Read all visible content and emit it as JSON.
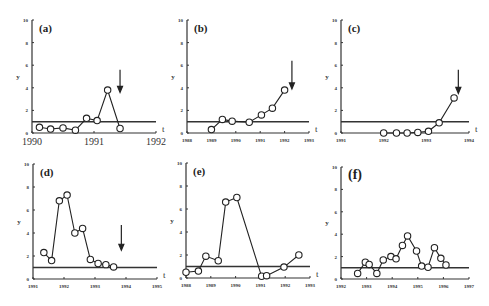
{
  "chart_data": [
    {
      "id": "a",
      "type": "line",
      "panel_label": "(a)",
      "ylabel": "y",
      "xlabel": "t",
      "ylim": [
        0,
        10
      ],
      "yticks": [
        0,
        2,
        4,
        6,
        8,
        10
      ],
      "xtick_labels": [
        "1990",
        "1991",
        "1992"
      ],
      "xlim": [
        1990,
        1992
      ],
      "threshold": 1,
      "points": [
        [
          1990.12,
          0.5
        ],
        [
          1990.3,
          0.35
        ],
        [
          1990.5,
          0.45
        ],
        [
          1990.7,
          0.25
        ],
        [
          1990.88,
          1.3
        ],
        [
          1991.05,
          1.1
        ],
        [
          1991.22,
          3.8
        ],
        [
          1991.42,
          0.4
        ]
      ],
      "arrow_x": 1991.42,
      "arrow_y_top": 5.6,
      "arrow_y_bottom": 3.6,
      "box": {
        "x": 32,
        "y": 20,
        "w": 124,
        "h": 113
      }
    },
    {
      "id": "b",
      "type": "line",
      "panel_label": "(b)",
      "ylabel": "y",
      "xlabel": "t",
      "ylim": [
        0,
        10
      ],
      "yticks": [
        0,
        2,
        4,
        6,
        8,
        10
      ],
      "xtick_labels": [
        "1988",
        "1989",
        "1990",
        "1991",
        "1992",
        "1993"
      ],
      "xlim": [
        1988,
        1993
      ],
      "threshold": 1,
      "points": [
        [
          1989,
          0.3
        ],
        [
          1989.45,
          1.2
        ],
        [
          1989.85,
          1.05
        ],
        [
          1990.55,
          0.95
        ],
        [
          1991.05,
          1.6
        ],
        [
          1991.5,
          2.2
        ],
        [
          1992,
          3.8
        ]
      ],
      "arrow_x": 1992.3,
      "arrow_y_top": 6.4,
      "arrow_y_bottom": 3.9,
      "box": {
        "x": 187,
        "y": 20,
        "w": 122,
        "h": 113
      }
    },
    {
      "id": "c",
      "type": "line",
      "panel_label": "(c)",
      "ylabel": "y",
      "xlabel": "t",
      "ylim": [
        0,
        10
      ],
      "yticks": [
        0,
        2,
        4,
        6,
        8,
        10
      ],
      "xtick_labels": [
        "1991",
        "1992",
        "1993",
        "1994"
      ],
      "xlim": [
        1991,
        1994
      ],
      "threshold": 1,
      "points": [
        [
          1992,
          0
        ],
        [
          1992.3,
          0
        ],
        [
          1992.55,
          0
        ],
        [
          1992.8,
          0.05
        ],
        [
          1993.05,
          0.15
        ],
        [
          1993.3,
          0.9
        ],
        [
          1993.65,
          3.1
        ]
      ],
      "arrow_x": 1993.75,
      "arrow_y_top": 5.6,
      "arrow_y_bottom": 3.5,
      "box": {
        "x": 341,
        "y": 20,
        "w": 128,
        "h": 113
      }
    },
    {
      "id": "d",
      "type": "line",
      "panel_label": "(d)",
      "ylabel": "y",
      "xlabel": "t",
      "ylim": [
        0,
        10
      ],
      "yticks": [
        0,
        2,
        4,
        6,
        8,
        10
      ],
      "xtick_labels": [
        "1991",
        "1992",
        "1993",
        "1994",
        "1995"
      ],
      "xlim": [
        1991,
        1995
      ],
      "threshold": 1,
      "points": [
        [
          1991.35,
          2.3
        ],
        [
          1991.6,
          1.6
        ],
        [
          1991.85,
          6.8
        ],
        [
          1992.1,
          7.3
        ],
        [
          1992.35,
          4.0
        ],
        [
          1992.6,
          4.4
        ],
        [
          1992.85,
          1.7
        ],
        [
          1993.1,
          1.35
        ],
        [
          1993.35,
          1.25
        ],
        [
          1993.6,
          1.05
        ]
      ],
      "arrow_x": 1993.85,
      "arrow_y_top": 4.7,
      "arrow_y_bottom": 2.5,
      "box": {
        "x": 33,
        "y": 164,
        "w": 124,
        "h": 115
      }
    },
    {
      "id": "e",
      "type": "line",
      "panel_label": "(e)",
      "ylabel": "y",
      "xlabel": "t",
      "ylim": [
        0,
        10
      ],
      "yticks": [
        0,
        2,
        4,
        6,
        8,
        10
      ],
      "xtick_labels": [
        "1988",
        "1989",
        "1990",
        "1991",
        "1992",
        "1993"
      ],
      "xlim": [
        1988,
        1993
      ],
      "threshold": 1,
      "points": [
        [
          1988,
          0.5
        ],
        [
          1988.5,
          0.6
        ],
        [
          1988.8,
          1.9
        ],
        [
          1989.3,
          1.5
        ],
        [
          1989.6,
          6.6
        ],
        [
          1990.05,
          7.0
        ],
        [
          1991.05,
          0.15
        ],
        [
          1991.25,
          0.2
        ],
        [
          1991.95,
          0.95
        ],
        [
          1992.55,
          2.0
        ]
      ],
      "box": {
        "x": 186,
        "y": 163,
        "w": 124,
        "h": 115
      }
    },
    {
      "id": "f",
      "type": "line",
      "panel_label": "(f)",
      "ylabel": "y",
      "xlabel": "",
      "ylim": [
        0,
        10
      ],
      "yticks": [
        0,
        2,
        4,
        6,
        8,
        10
      ],
      "xtick_labels": [
        "1992",
        "1993",
        "1994",
        "1995",
        "1996",
        "1997"
      ],
      "xlim": [
        1992,
        1997
      ],
      "threshold": 1,
      "points": [
        [
          1992.65,
          0.5
        ],
        [
          1992.95,
          1.5
        ],
        [
          1993.1,
          1.3
        ],
        [
          1993.4,
          0.5
        ],
        [
          1993.65,
          1.7
        ],
        [
          1993.95,
          2.0
        ],
        [
          1994.15,
          1.8
        ],
        [
          1994.4,
          3.0
        ],
        [
          1994.6,
          3.85
        ],
        [
          1994.95,
          2.5
        ],
        [
          1995.15,
          1.15
        ],
        [
          1995.4,
          1.05
        ],
        [
          1995.65,
          2.8
        ],
        [
          1995.9,
          1.85
        ],
        [
          1996.1,
          1.25
        ]
      ],
      "box": {
        "x": 341,
        "y": 167,
        "w": 128,
        "h": 112
      }
    }
  ],
  "axis_text": {
    "y": "y",
    "t": "t"
  }
}
